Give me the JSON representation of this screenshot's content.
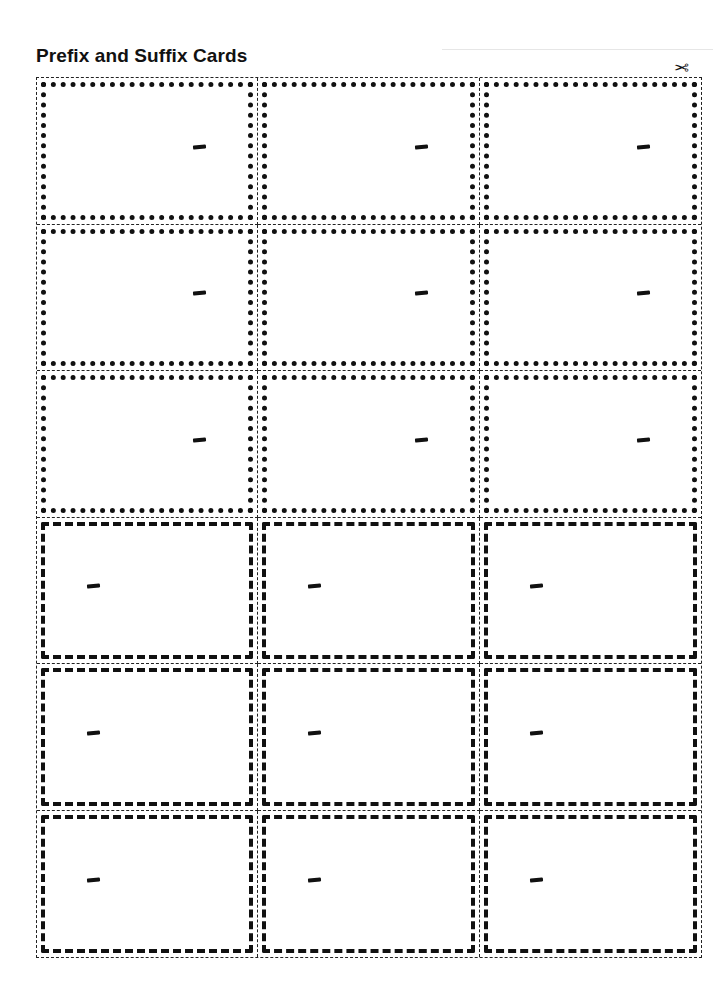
{
  "page": {
    "title": "Prefix and Suffix Cards",
    "cut_icon": "scissors-icon"
  },
  "cards": {
    "columns": 3,
    "rows": [
      {
        "style": "dotted",
        "type": "suffix",
        "cells": [
          {
            "text": ""
          },
          {
            "text": ""
          },
          {
            "text": ""
          }
        ]
      },
      {
        "style": "dotted",
        "type": "suffix",
        "cells": [
          {
            "text": ""
          },
          {
            "text": ""
          },
          {
            "text": ""
          }
        ]
      },
      {
        "style": "dotted",
        "type": "suffix",
        "cells": [
          {
            "text": ""
          },
          {
            "text": ""
          },
          {
            "text": ""
          }
        ]
      },
      {
        "style": "dashed",
        "type": "prefix",
        "cells": [
          {
            "text": ""
          },
          {
            "text": ""
          },
          {
            "text": ""
          }
        ]
      },
      {
        "style": "dashed",
        "type": "prefix",
        "cells": [
          {
            "text": ""
          },
          {
            "text": ""
          },
          {
            "text": ""
          }
        ]
      },
      {
        "style": "dashed",
        "type": "prefix",
        "cells": [
          {
            "text": ""
          },
          {
            "text": ""
          },
          {
            "text": ""
          }
        ]
      }
    ]
  },
  "colors": {
    "ink": "#111111",
    "cut_line": "#222222",
    "paper": "#ffffff"
  }
}
